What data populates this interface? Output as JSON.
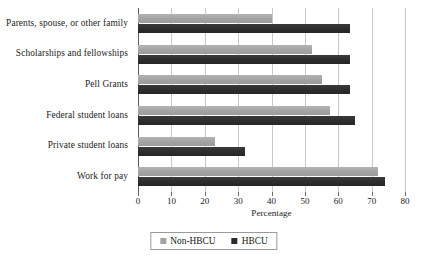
{
  "chart_data": {
    "type": "bar",
    "orientation": "horizontal",
    "title": "",
    "xlabel": "Percentage",
    "ylabel": "",
    "xlim": [
      0,
      80
    ],
    "xticks": [
      0,
      10,
      20,
      30,
      40,
      50,
      60,
      70,
      80
    ],
    "grid": "vertical",
    "legend_position": "bottom-center",
    "categories": [
      "Parents, spouse, or other family",
      "Scholarships and fellowships",
      "Pell Grants",
      "Federal student loans",
      "Private student loans",
      "Work for pay"
    ],
    "series": [
      {
        "name": "Non-HBCU",
        "color": "#a3a3a3",
        "values": [
          40,
          52,
          55,
          57.5,
          23,
          72
        ]
      },
      {
        "name": "HBCU",
        "color": "#2d2d2d",
        "values": [
          63.5,
          63.5,
          63.5,
          65,
          32,
          74
        ]
      }
    ]
  },
  "legend": {
    "items": [
      {
        "label": "Non-HBCU",
        "color": "#a3a3a3"
      },
      {
        "label": "HBCU",
        "color": "#2d2d2d"
      }
    ]
  }
}
